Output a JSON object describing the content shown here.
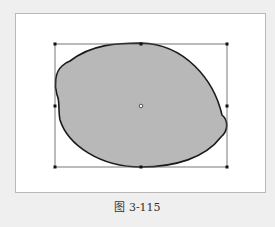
{
  "figure": {
    "caption": "图 3-115"
  },
  "colors": {
    "page_background": "#efefef",
    "panel_background": "#ffffff",
    "panel_border": "#b9b9b9",
    "shape_fill": "#b8b8b8",
    "shape_stroke": "#1a1a1a",
    "bounding_box": "#555555",
    "handle": "#111111"
  },
  "shape": {
    "type": "lemon-shape",
    "bounding_box": {
      "left": 55,
      "top": 44,
      "right": 227,
      "bottom": 167
    },
    "center": {
      "x": 141,
      "y": 106
    }
  }
}
